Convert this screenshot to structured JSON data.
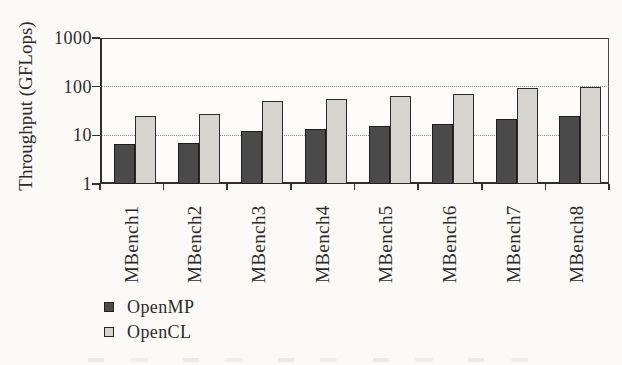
{
  "chart_data": {
    "type": "bar",
    "title": "",
    "ylabel": "Throughput (GFLops)",
    "xlabel": "",
    "scale": "log",
    "ylim": [
      1,
      1000
    ],
    "yticks": [
      1,
      10,
      100,
      1000
    ],
    "ytick_labels": [
      "1",
      "10",
      "100",
      "1000"
    ],
    "grid": "horizontal dotted lines at 10 and 100; solid frame at 1000",
    "legend_position": "bottom-left",
    "categories": [
      "MBench1",
      "MBench2",
      "MBench3",
      "MBench4",
      "MBench5",
      "MBench6",
      "MBench7",
      "MBench8"
    ],
    "series": [
      {
        "name": "OpenMP",
        "color": "#4a4a4a",
        "values": [
          6.5,
          7,
          12,
          13.5,
          15.5,
          17,
          22,
          25
        ]
      },
      {
        "name": "OpenCL",
        "color": "#d6d4cf",
        "values": [
          25,
          28,
          50,
          55,
          65,
          70,
          92,
          100
        ]
      }
    ]
  },
  "colors": {
    "background": "#fbfaf6",
    "axis": "#333333",
    "grid_dot": "#8d8d8d",
    "text": "#2b2b2b",
    "openmp_fill": "#4a4a4a",
    "opencl_fill": "#d6d4cf"
  }
}
